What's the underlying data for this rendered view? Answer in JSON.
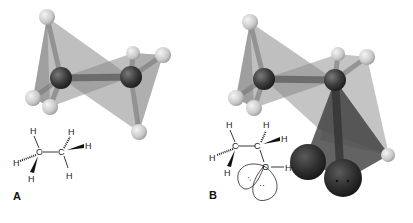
{
  "figure": {
    "panels": [
      {
        "label": "A",
        "molecule": "ethane",
        "formula_atoms": {
          "c1": "C",
          "c2": "C",
          "h_top_left": "H",
          "h_left": "H",
          "h_bottom_left": "H",
          "h_top_right": "H",
          "h_right": "H",
          "h_bottom_right": "H"
        }
      },
      {
        "label": "B",
        "molecule": "ethanol",
        "formula_atoms": {
          "c1": "C",
          "c2": "C",
          "o": "O",
          "h_top_left": "H",
          "h_left": "H",
          "h_bottom_left": "H",
          "h_top_right": "H",
          "h_right": "H",
          "h_oh": "H",
          "lone_pair_1": "··",
          "lone_pair_2": "··"
        }
      }
    ],
    "colors": {
      "background": "#ffffff",
      "tetrahedron": "#8a8a8a",
      "carbon": "#3a3a3a",
      "hydrogen": "#d4d4d4",
      "oxygen_lobe": "#2e2e2e",
      "oxygen_tetra": "#3c3c3c",
      "line": "#222222"
    }
  }
}
